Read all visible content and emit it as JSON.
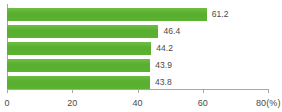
{
  "chart_data": {
    "type": "bar",
    "orientation": "horizontal",
    "title": "",
    "subtitle": "",
    "xlabel": "",
    "ylabel": "",
    "unit": "(%)",
    "xlim": [
      0,
      80
    ],
    "grid": false,
    "legend": false,
    "categories": [
      "",
      "",
      "",
      "",
      ""
    ],
    "values": [
      61.2,
      46.4,
      44.2,
      43.9,
      43.8
    ],
    "data_labels": [
      "61.2",
      "46.4",
      "44.2",
      "43.9",
      "43.8"
    ],
    "axis_ticks": [
      0,
      20,
      40,
      60,
      80
    ],
    "axis_tick_labels": [
      "0",
      "20",
      "40",
      "60",
      "80"
    ],
    "axis_end_label": "80(%)",
    "colors": {
      "bar": "#5cb232",
      "bar_light": "#6fbd43",
      "axis": "#a8a8a8",
      "text": "#4a4a4a",
      "background": "#ffffff"
    }
  }
}
